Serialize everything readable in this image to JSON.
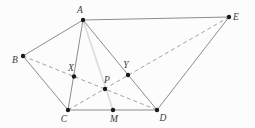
{
  "figure": {
    "name": "geometry-diagram",
    "canvas": {
      "width": 255,
      "height": 128,
      "background": "#fcfcfc"
    },
    "style": {
      "solid_color": "#7f7f7f",
      "dashed_color": "#979797",
      "light_color": "#d9ded9",
      "dot_color": "#1a1a1a",
      "label_color": "#3b3b3b",
      "dash_pattern": "4 3",
      "dot_radius": 2.2,
      "label_font_size": 9.5
    },
    "points": [
      {
        "id": "A",
        "x": 83,
        "y": 20,
        "lx": 80,
        "ly": 12.5
      },
      {
        "id": "B",
        "x": 23,
        "y": 56,
        "lx": 15,
        "ly": 62.5
      },
      {
        "id": "C",
        "x": 68,
        "y": 110,
        "lx": 64,
        "ly": 121.5
      },
      {
        "id": "M",
        "x": 113,
        "y": 110,
        "lx": 114,
        "ly": 121.5
      },
      {
        "id": "D",
        "x": 157,
        "y": 110,
        "lx": 163,
        "ly": 120.5
      },
      {
        "id": "E",
        "x": 229,
        "y": 17,
        "lx": 236,
        "ly": 19.5
      },
      {
        "id": "X",
        "x": 74,
        "y": 76.5,
        "lx": 71,
        "ly": 70.5
      },
      {
        "id": "Y",
        "x": 128,
        "y": 75,
        "lx": 126,
        "ly": 68
      },
      {
        "id": "P",
        "x": 105,
        "y": 89,
        "lx": 107,
        "ly": 83
      }
    ],
    "edges": {
      "light": [
        [
          "A",
          "M"
        ]
      ],
      "solid": [
        [
          "A",
          "B"
        ],
        [
          "A",
          "C"
        ],
        [
          "A",
          "D"
        ],
        [
          "A",
          "E"
        ],
        [
          "B",
          "C"
        ],
        [
          "C",
          "D"
        ],
        [
          "D",
          "E"
        ]
      ],
      "dashed": [
        [
          "B",
          "D"
        ],
        [
          "C",
          "E"
        ]
      ]
    }
  }
}
